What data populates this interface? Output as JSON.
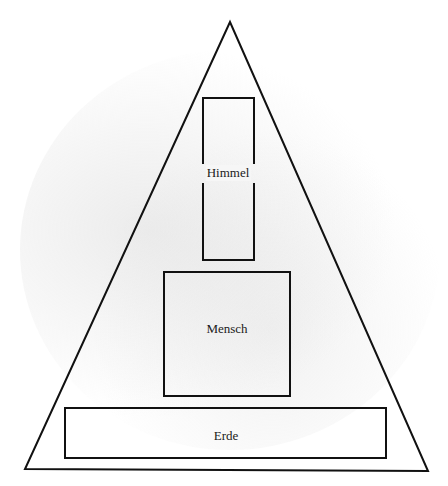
{
  "diagram": {
    "type": "hierarchy-triangle",
    "colors": {
      "stroke": "#111111",
      "background": "#ffffff",
      "texture": "#d6d6d6"
    },
    "triangle": {
      "apex": [
        230,
        22
      ],
      "bottom_left": [
        25,
        469
      ],
      "bottom_right": [
        428,
        471
      ]
    },
    "boxes": [
      {
        "id": "himmel",
        "label": "Himmel",
        "x": 202,
        "y": 98,
        "w": 53,
        "h": 162,
        "label_pos": [
          228,
          173
        ]
      },
      {
        "id": "mensch",
        "label": "Mensch",
        "x": 164,
        "y": 272,
        "w": 126,
        "h": 124,
        "label_pos": [
          227,
          329
        ]
      },
      {
        "id": "erde",
        "label": "Erde",
        "x": 65,
        "y": 408,
        "w": 321,
        "h": 50,
        "label_pos": [
          226,
          436
        ]
      }
    ]
  }
}
